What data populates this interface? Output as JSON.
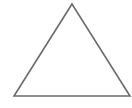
{
  "diagram": {
    "shape": "triangle",
    "fill": "#ffffff",
    "stroke": "#6b6b6b",
    "stroke_width": 1.6,
    "vertices": [
      [
        72,
        4
      ],
      [
        14,
        96
      ],
      [
        130,
        96
      ]
    ]
  }
}
